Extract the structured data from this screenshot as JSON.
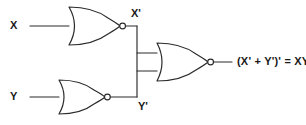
{
  "diagram": {
    "stroke_color": "#2b2b2b",
    "background_color": "#ffffff",
    "labels": {
      "input_x": "X",
      "input_y": "Y",
      "node_x_not": "X'",
      "node_y_not": "Y'",
      "output_expression": "(X' + Y')' = XY"
    },
    "gates": [
      {
        "name": "nor-gate-x",
        "type": "NOR",
        "inputs": [
          "X"
        ],
        "output": "X'"
      },
      {
        "name": "nor-gate-y",
        "type": "NOR",
        "inputs": [
          "Y"
        ],
        "output": "Y'"
      },
      {
        "name": "nor-gate-output",
        "type": "NOR",
        "inputs": [
          "X'",
          "Y'"
        ],
        "output": "(X' + Y')' = XY"
      }
    ]
  }
}
